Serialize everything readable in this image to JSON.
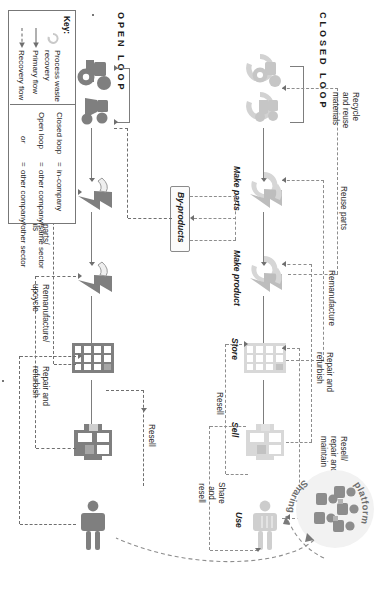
{
  "diagram": {
    "tracks": [
      {
        "id": "closed",
        "label": "CLOSED LOOP",
        "tone": "#c9c9c9"
      },
      {
        "id": "open",
        "label": "OPEN LOOP",
        "tone": "#7f7f7f"
      }
    ],
    "stages": {
      "make_parts": "Make parts",
      "make_product": "Make product",
      "store": "Store",
      "sell": "Sell",
      "use": "Use"
    },
    "byproducts_label": "By-products",
    "sharing_platform_label": "Sharing platform",
    "closed_loop_recovery": [
      "Recycle\nand reuse\nmaterials",
      "Reuse parts",
      "Remanufacture",
      "Repair and\nrefurbish",
      "Resell/\nrepair and\nmaintain"
    ],
    "closed_loop_forward": [
      "Resell",
      "Share\nand\nresell"
    ],
    "open_loop_recovery": [
      "Reuse parts/\nmaterials",
      "Remanufacture/\nupcycle",
      "Repair and\nrefurbish",
      "Resell"
    ],
    "key": {
      "title": "Key:",
      "items": [
        {
          "glyph": "process-waste-recovery-icon",
          "label": "Process waste\nrecovery"
        },
        {
          "glyph": "solid-arrow-icon",
          "label": "Primary flow"
        },
        {
          "glyph": "dashed-arrow-icon",
          "label": "Recovery flow"
        }
      ],
      "loops": [
        {
          "term": "Closed loop",
          "eq": "=",
          "meaning": "in-company"
        },
        {
          "term": "Open loop",
          "eq": "=",
          "meaning": "other company/same sector"
        },
        {
          "term": "or",
          "eq": "=",
          "meaning": "other company/other sector"
        }
      ]
    },
    "colors": {
      "closed_tone": "#c9c9c9",
      "open_tone": "#7f7f7f",
      "line": "#7d7d7d",
      "dash": "#8d8d8d",
      "text": "#1c1c1c"
    }
  }
}
